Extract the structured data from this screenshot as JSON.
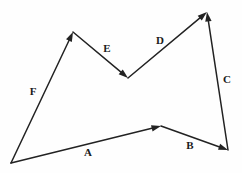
{
  "figure": {
    "type": "vector-diagram",
    "background_color": "#fefefe",
    "stroke_color": "#222222",
    "label_color": "#1a1a1a",
    "width": 242,
    "height": 173,
    "vertices": [
      {
        "id": "P0",
        "name": "bottom-left",
        "x": 11,
        "y": 163
      },
      {
        "id": "P1",
        "name": "bottom-middle",
        "x": 161,
        "y": 126
      },
      {
        "id": "P2",
        "name": "bottom-right",
        "x": 228,
        "y": 150
      },
      {
        "id": "P3",
        "name": "top-right-peak",
        "x": 207,
        "y": 12
      },
      {
        "id": "P4",
        "name": "middle-valley",
        "x": 128,
        "y": 78
      },
      {
        "id": "P5",
        "name": "top-left-peak",
        "x": 73,
        "y": 32
      }
    ],
    "vectors": [
      {
        "label": "A",
        "from": "P0",
        "to": "P1",
        "x1": 11,
        "y1": 163,
        "x2": 161,
        "y2": 126,
        "label_x": 88,
        "label_y": 153,
        "direction": "up-right"
      },
      {
        "label": "B",
        "from": "P1",
        "to": "P2",
        "x1": 161,
        "y1": 126,
        "x2": 228,
        "y2": 150,
        "label_x": 190,
        "label_y": 146,
        "direction": "down-right"
      },
      {
        "label": "C",
        "from": "P2",
        "to": "P3",
        "x1": 228,
        "y1": 150,
        "x2": 207,
        "y2": 12,
        "label_x": 227,
        "label_y": 80,
        "direction": "up"
      },
      {
        "label": "D",
        "from": "P4",
        "to": "P3",
        "x1": 128,
        "y1": 78,
        "x2": 207,
        "y2": 12,
        "label_x": 160,
        "label_y": 41,
        "direction": "up-right"
      },
      {
        "label": "E",
        "from": "P5",
        "to": "P4",
        "x1": 73,
        "y1": 32,
        "x2": 128,
        "y2": 78,
        "label_x": 107,
        "label_y": 49,
        "direction": "down-right"
      },
      {
        "label": "F",
        "from": "P0",
        "to": "P5",
        "x1": 11,
        "y1": 163,
        "x2": 73,
        "y2": 32,
        "label_x": 33,
        "label_y": 92,
        "direction": "up-right"
      }
    ],
    "arrowheads": [
      {
        "for": "A",
        "at_x": 161,
        "at_y": 126,
        "angle_deg": -13.9
      },
      {
        "for": "B",
        "at_x": 228,
        "at_y": 150,
        "angle_deg": 19.7
      },
      {
        "for": "C",
        "at_x": 207,
        "at_y": 12,
        "angle_deg": -98.7
      },
      {
        "for": "D",
        "at_x": 207,
        "at_y": 12,
        "angle_deg": -39.9
      },
      {
        "for": "E",
        "at_x": 128,
        "at_y": 78,
        "angle_deg": 39.9
      },
      {
        "for": "F",
        "at_x": 11,
        "at_y": 163,
        "angle_deg": 115.3
      }
    ]
  }
}
